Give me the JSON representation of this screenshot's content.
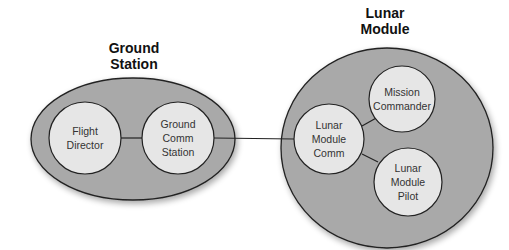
{
  "groups": [
    {
      "id": "ground",
      "title": "Ground\nStation"
    },
    {
      "id": "lunar",
      "title": "Lunar\nModule"
    }
  ],
  "nodes": [
    {
      "id": "flight-director",
      "label": "Flight\nDirector"
    },
    {
      "id": "ground-comm-station",
      "label": "Ground\nComm\nStation"
    },
    {
      "id": "lunar-module-comm",
      "label": "Lunar\nModule\nComm"
    },
    {
      "id": "mission-commander",
      "label": "Mission\nCommander"
    },
    {
      "id": "lunar-module-pilot",
      "label": "Lunar\nModule\nPilot"
    }
  ],
  "edges": [
    [
      "flight-director",
      "ground-comm-station"
    ],
    [
      "ground-comm-station",
      "lunar-module-comm"
    ],
    [
      "lunar-module-comm",
      "mission-commander"
    ],
    [
      "lunar-module-comm",
      "lunar-module-pilot"
    ]
  ],
  "colors": {
    "group_fill": "#a9a9a9",
    "node_fill": "#e6e6e6",
    "stroke": "#222222"
  }
}
